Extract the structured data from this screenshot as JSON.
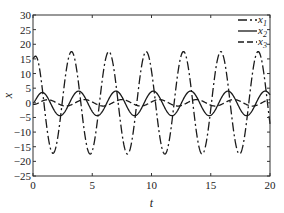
{
  "chart_data": {
    "type": "line",
    "title": "",
    "xlabel": "t",
    "ylabel": "x",
    "xlim": [
      0,
      20
    ],
    "ylim": [
      -25,
      30
    ],
    "xticks": [
      0,
      5,
      10,
      15,
      20
    ],
    "yticks": [
      30,
      25,
      20,
      15,
      10,
      5,
      0,
      -5,
      -10,
      -15,
      -20,
      -25
    ],
    "grid": false,
    "legend_position": "upper right",
    "series": [
      {
        "name": "x1",
        "label_base": "x",
        "label_sub": "1",
        "style": "dash-dot",
        "approx_model": {
          "amplitude": 17.5,
          "offset": 0,
          "period": 3.15,
          "first_peak_t": 3.25
        },
        "initial_value": 15,
        "peaks_t": [
          3.25,
          6.4,
          9.55,
          12.7,
          15.85,
          19.0
        ],
        "troughs_t": [
          1.66,
          4.8,
          7.95,
          11.1,
          14.25,
          17.4
        ],
        "peak_value": 17.5,
        "trough_value": -17.5
      },
      {
        "name": "x2",
        "label_base": "x",
        "label_sub": "2",
        "style": "solid",
        "approx_model": {
          "amplitude": 4.2,
          "offset": -0.2,
          "period": 3.15,
          "first_peak_t": 0.7
        },
        "initial_value": 0,
        "peak_value": 4,
        "trough_value": -4.5
      },
      {
        "name": "x3",
        "label_base": "x",
        "label_sub": "3",
        "style": "dashed",
        "approx_model": {
          "amplitude": 1.1,
          "offset": 0,
          "period": 3.15,
          "first_peak_t": 1.2
        },
        "initial_value": -0.5,
        "peak_value": 1,
        "trough_value": -1.2
      }
    ]
  },
  "axes": {
    "xlabel": "t",
    "ylabel": "x"
  },
  "legend": {
    "items": [
      {
        "base": "x",
        "sub": "1"
      },
      {
        "base": "x",
        "sub": "2"
      },
      {
        "base": "x",
        "sub": "3"
      }
    ]
  }
}
